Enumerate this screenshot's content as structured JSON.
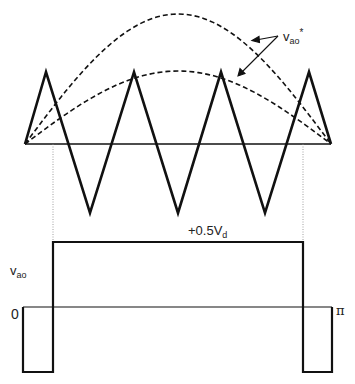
{
  "diagram": {
    "colors": {
      "stroke": "#111111",
      "text": "#222222",
      "background": "#ffffff",
      "dotted": "#888888"
    },
    "carrier": {
      "type": "triangle",
      "baseline_y": 144,
      "peak_y": 72,
      "valley_y": 213,
      "points": [
        [
          25,
          144
        ],
        [
          46,
          72
        ],
        [
          90,
          213
        ],
        [
          134,
          72
        ],
        [
          178,
          213
        ],
        [
          221,
          72
        ],
        [
          265,
          213
        ],
        [
          309,
          72
        ],
        [
          331,
          144
        ]
      ]
    },
    "reference_signals": {
      "label_main": "v",
      "label_sub": "ao",
      "label_sup": "*",
      "large_arc": {
        "x_start": 25,
        "x_end": 331,
        "peak_y": 14,
        "baseline_y": 144
      },
      "small_arc": {
        "x_start": 25,
        "x_end": 331,
        "peak_y": 71,
        "baseline_y": 144
      },
      "arrows": [
        {
          "from": [
            278,
            36
          ],
          "to": [
            252,
            40
          ]
        },
        {
          "from": [
            278,
            36
          ],
          "to": [
            238,
            76
          ]
        }
      ]
    },
    "projection_lines": [
      {
        "x": 53,
        "y1": 144,
        "y2": 242
      },
      {
        "x": 303,
        "y1": 144,
        "y2": 242
      }
    ],
    "output_waveform": {
      "label_main": "v",
      "label_sub": "ao",
      "high_label_prefix": "+0.5V",
      "high_label_sub": "d",
      "zero_label": "0",
      "end_label": "π",
      "zero_y": 307,
      "high_y": 242,
      "low_y": 372,
      "x_start": 23,
      "x_end": 332,
      "switch_on_x": 53,
      "switch_off_x": 303
    }
  }
}
